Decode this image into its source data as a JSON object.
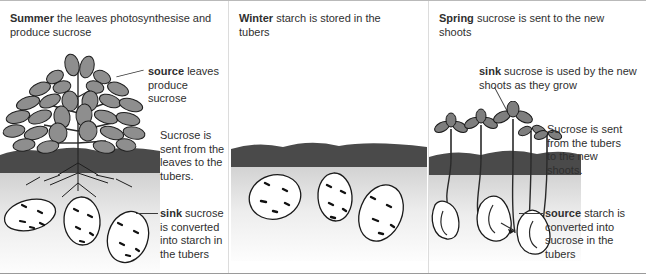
{
  "diagram": {
    "title_concept": "Sucrose source and sink in the potato plant across seasons",
    "panels": [
      {
        "id": "summer",
        "season": "Summer",
        "heading_rest": "the leaves photosynthesise and produce sucrose",
        "annotations": [
          {
            "id": "source-leaves",
            "bold": "source",
            "rest": "leaves produce sucrose"
          },
          {
            "id": "transport-summer",
            "bold": "",
            "rest": "Sucrose is sent from the leaves to the tubers."
          },
          {
            "id": "sink-tubers",
            "bold": "sink",
            "rest": "sucrose is converted into starch in the tubers"
          }
        ],
        "scene": {
          "above_ground": "leafy potato plant with many gray leaves",
          "soil_band": "dark gray soil",
          "below_ground": "three white tubers with dark eyes attached to roots"
        }
      },
      {
        "id": "winter",
        "season": "Winter",
        "heading_rest": "starch is stored in the tubers",
        "annotations": [],
        "scene": {
          "above_ground": "bare ground, no shoots",
          "soil_band": "dark gray soil",
          "below_ground": "three white tubers with dark eyes"
        }
      },
      {
        "id": "spring",
        "season": "Spring",
        "heading_rest": "sucrose is sent to the new shoots",
        "annotations": [
          {
            "id": "sink-shoots",
            "bold": "sink",
            "rest": "sucrose is used by the new shoots as they grow"
          },
          {
            "id": "transport-spring",
            "bold": "",
            "rest": "Sucrose is sent from the tubers to the new shoots."
          },
          {
            "id": "source-tubers",
            "bold": "source",
            "rest": "starch is converted into sucrose in the tubers"
          }
        ],
        "scene": {
          "above_ground": "several small new shoots with young leaves",
          "soil_band": "dark gray soil",
          "below_ground": "shrivelled white tubers with long pale stems rising to the shoots"
        }
      }
    ],
    "colors": {
      "text": "#2f2f2f",
      "soil": "#4a4a4a",
      "leaf_fill": "#8e8e8e",
      "tuber_fill": "#ffffff",
      "outline": "#1a1a1a",
      "underground": "#e9e9e9",
      "divider": "#dcdcdc"
    }
  }
}
